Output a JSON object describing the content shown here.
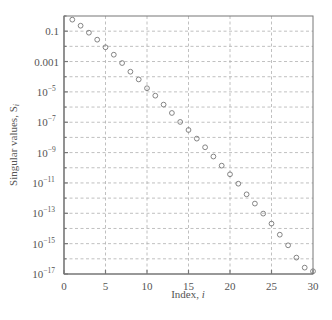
{
  "chart_data": {
    "type": "scatter",
    "title": "",
    "xlabel": "Index, i",
    "xlabel_text": "Index, ",
    "xlabel_var": "i",
    "ylabel": "Singular values, S_i",
    "ylabel_text": "Singular values, S",
    "ylabel_sub": "i",
    "xlim": [
      0,
      30
    ],
    "ylim": [
      1e-17,
      1
    ],
    "yscale": "log",
    "grid": true,
    "legend": null,
    "marker": "open-circle",
    "x_ticks": [
      0,
      5,
      10,
      15,
      20,
      25,
      30
    ],
    "x_tick_labels": [
      "0",
      "5",
      "10",
      "15",
      "20",
      "25",
      "30"
    ],
    "y_tick_labels": [
      {
        "exp": -1,
        "base": "0.1",
        "sup": ""
      },
      {
        "exp": -3,
        "base": "0.001",
        "sup": ""
      },
      {
        "exp": -5,
        "base": "10",
        "sup": "−5"
      },
      {
        "exp": -7,
        "base": "10",
        "sup": "−7"
      },
      {
        "exp": -9,
        "base": "10",
        "sup": "−9"
      },
      {
        "exp": -11,
        "base": "10",
        "sup": "−11"
      },
      {
        "exp": -13,
        "base": "10",
        "sup": "−13"
      },
      {
        "exp": -15,
        "base": "10",
        "sup": "−15"
      },
      {
        "exp": -17,
        "base": "10",
        "sup": "−17"
      }
    ],
    "series": [
      {
        "name": "Singular values",
        "x": [
          1,
          2,
          3,
          4,
          5,
          6,
          7,
          8,
          9,
          10,
          11,
          12,
          13,
          14,
          15,
          16,
          17,
          18,
          19,
          20,
          21,
          22,
          23,
          24,
          25,
          26,
          27,
          28,
          29,
          30
        ],
        "log10_values": [
          -0.24,
          -0.64,
          -1.1,
          -1.56,
          -2.06,
          -2.55,
          -3.1,
          -3.67,
          -4.18,
          -4.76,
          -5.25,
          -5.84,
          -6.39,
          -6.98,
          -7.51,
          -8.08,
          -8.65,
          -9.26,
          -9.86,
          -10.43,
          -11.05,
          -11.75,
          -12.36,
          -13.02,
          -13.68,
          -14.41,
          -15.11,
          -15.92,
          -16.58,
          -16.82
        ],
        "values": [
          0.57,
          0.23,
          0.079,
          0.027,
          0.0087,
          0.0028,
          0.0008,
          0.00021,
          6.6e-05,
          1.7e-05,
          5.6e-06,
          1.4e-06,
          4.1e-07,
          1e-07,
          3.1e-08,
          8.3e-09,
          2.2e-09,
          5.5e-10,
          1.4e-10,
          3.7e-11,
          8.9e-12,
          1.8e-12,
          4.3e-13,
          9.5e-14,
          2.1e-14,
          3.9e-15,
          7.8e-16,
          1.2e-16,
          2.6e-17,
          1.5e-17
        ]
      }
    ]
  }
}
